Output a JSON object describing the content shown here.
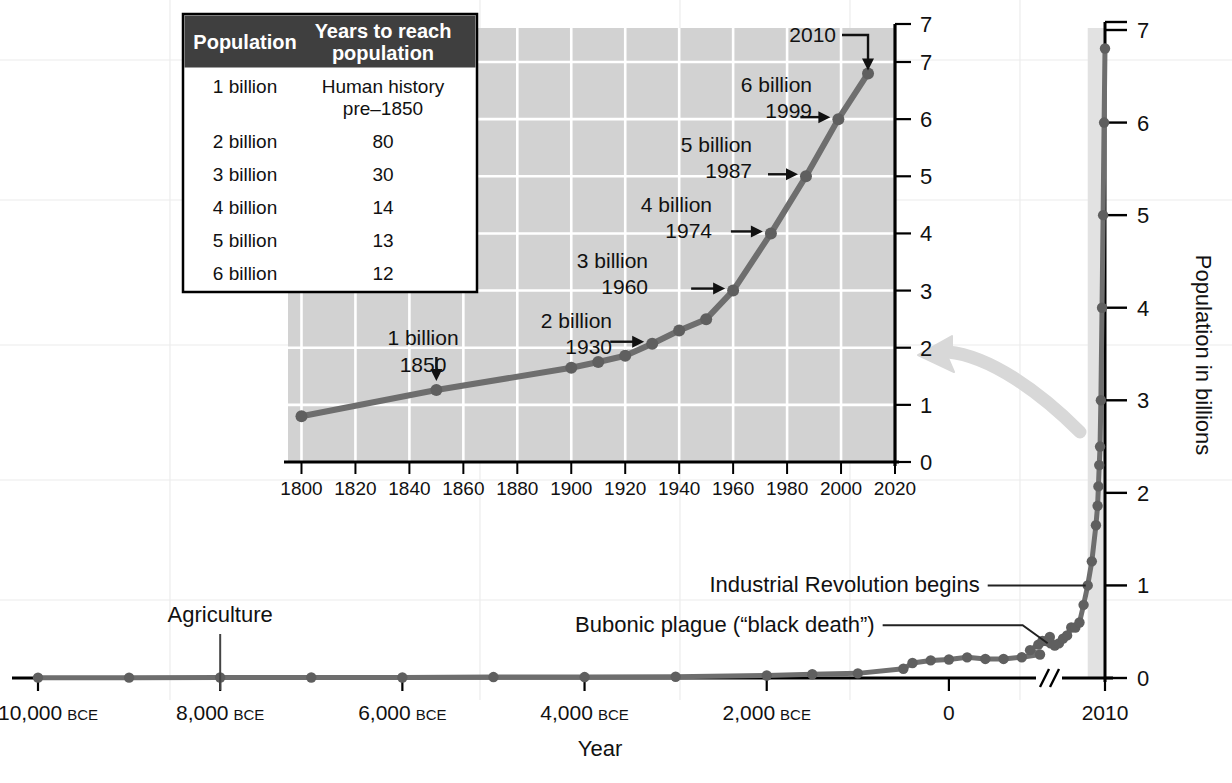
{
  "figure": {
    "main_xlabel": "Year",
    "main_ylabel": "Population in billions"
  },
  "table": {
    "headers": [
      "Population",
      "Years to reach population"
    ],
    "header_col1": "Population",
    "header_col2_line1": "Years to reach",
    "header_col2_line2": "population",
    "rows": [
      {
        "population": "1 billion",
        "years_line1": "Human history",
        "years_line2": "pre–1850"
      },
      {
        "population": "2 billion",
        "years_line1": "80",
        "years_line2": ""
      },
      {
        "population": "3 billion",
        "years_line1": "30",
        "years_line2": ""
      },
      {
        "population": "4 billion",
        "years_line1": "14",
        "years_line2": ""
      },
      {
        "population": "5 billion",
        "years_line1": "13",
        "years_line2": ""
      },
      {
        "population": "6 billion",
        "years_line1": "12",
        "years_line2": ""
      }
    ],
    "header_bg": "#3f3f3f",
    "body_bg": "#ffffff",
    "border": "#000000"
  },
  "colors": {
    "line": "#6e6e6e",
    "marker": "#5f5f5f",
    "inset_plot_bg": "#d2d2d2",
    "inset_grid": "#ffffff",
    "axis": "#000000",
    "main_grid": "#ececec",
    "highlight_band": "#e2e2e2",
    "callout_arrow": "#d8d8d8",
    "text": "#111111"
  },
  "chart_data": [
    {
      "id": "main",
      "type": "line",
      "title": "",
      "xlabel": "Year",
      "ylabel": "Population in billions",
      "xlim": [
        -10000,
        2010
      ],
      "ylim": [
        0,
        7
      ],
      "grid": true,
      "legend": "none",
      "axis_break": true,
      "axis_break_note": "break in x-axis between 1000 CE and 1500 CE region",
      "xticks": [
        -10000,
        -8000,
        -6000,
        -4000,
        -2000,
        0,
        2010
      ],
      "xticklabels": [
        "10,000 BCE",
        "8,000 BCE",
        "6,000 BCE",
        "4,000 BCE",
        "2,000 BCE",
        "0",
        "2010"
      ],
      "xtick_suffix": [
        "BCE",
        "BCE",
        "BCE",
        "BCE",
        "BCE",
        "",
        ""
      ],
      "xtick_numbers": [
        "10,000",
        "8,000",
        "6,000",
        "4,000",
        "2,000",
        "0",
        "2010"
      ],
      "yticks": [
        0,
        1,
        2,
        3,
        4,
        5,
        6,
        7
      ],
      "yticklabels": [
        "0",
        "1",
        "2",
        "3",
        "4",
        "5",
        "6",
        "7"
      ],
      "x": [
        -10000,
        -9000,
        -8000,
        -7000,
        -6000,
        -5000,
        -4000,
        -3000,
        -2000,
        -1500,
        -1000,
        -500,
        -400,
        -200,
        0,
        200,
        400,
        600,
        800,
        1000,
        1100,
        1200,
        1250,
        1300,
        1340,
        1350,
        1400,
        1450,
        1500,
        1550,
        1600,
        1650,
        1700,
        1750,
        1800,
        1850,
        1900,
        1920,
        1930,
        1940,
        1950,
        1960,
        1974,
        1987,
        1999,
        2010
      ],
      "y": [
        0.004,
        0.004,
        0.005,
        0.005,
        0.005,
        0.01,
        0.01,
        0.014,
        0.027,
        0.04,
        0.05,
        0.1,
        0.162,
        0.19,
        0.2,
        0.223,
        0.206,
        0.206,
        0.224,
        0.254,
        0.301,
        0.36,
        0.4,
        0.4,
        0.443,
        0.375,
        0.35,
        0.374,
        0.425,
        0.46,
        0.545,
        0.545,
        0.6,
        0.79,
        1.0,
        1.26,
        1.65,
        1.86,
        2.07,
        2.3,
        2.5,
        3.0,
        4.0,
        5.0,
        6.0,
        6.8
      ],
      "annotations": [
        {
          "label": "Agriculture",
          "x": -8000,
          "y": 0.005,
          "style": "vertical-leader"
        },
        {
          "label": "Bubonic plague (“black death”)",
          "x": 1350,
          "y": 0.375,
          "style": "horizontal-leader"
        },
        {
          "label": "Industrial Revolution begins",
          "x": 1800,
          "y": 1.0,
          "style": "horizontal-leader"
        }
      ],
      "highlight_band": {
        "x_start": 1800,
        "x_end": 2010
      }
    },
    {
      "id": "inset",
      "type": "line",
      "title": "",
      "xlabel": "",
      "ylabel": "",
      "xlim": [
        1795,
        2020
      ],
      "ylim": [
        0,
        7
      ],
      "grid": true,
      "legend": "none",
      "xticks": [
        1800,
        1820,
        1840,
        1860,
        1880,
        1900,
        1920,
        1940,
        1960,
        1980,
        2000,
        2020
      ],
      "xticklabels": [
        "1800",
        "1820",
        "1840",
        "1860",
        "1880",
        "1900",
        "1920",
        "1940",
        "1960",
        "1980",
        "2000",
        "2020"
      ],
      "yticks": [
        0,
        1,
        2,
        3,
        4,
        5,
        6,
        7
      ],
      "yticklabels": [
        "0",
        "1",
        "2",
        "3",
        "4",
        "5",
        "6",
        "7"
      ],
      "x": [
        1800,
        1850,
        1900,
        1910,
        1920,
        1930,
        1940,
        1950,
        1960,
        1974,
        1987,
        1999,
        2010
      ],
      "y": [
        0.8,
        1.26,
        1.65,
        1.75,
        1.86,
        2.07,
        2.3,
        2.5,
        3.0,
        4.0,
        5.0,
        6.0,
        6.8
      ],
      "annotations": [
        {
          "label_line1": "1 billion",
          "label_line2": "1850",
          "x": 1850,
          "y": 1.26,
          "arrow": "down"
        },
        {
          "label_line1": "2 billion",
          "label_line2": "1930",
          "x": 1930,
          "y": 2.07,
          "arrow": "right"
        },
        {
          "label_line1": "3 billion",
          "label_line2": "1960",
          "x": 1960,
          "y": 3.0,
          "arrow": "right"
        },
        {
          "label_line1": "4 billion",
          "label_line2": "1974",
          "x": 1974,
          "y": 4.0,
          "arrow": "right"
        },
        {
          "label_line1": "5 billion",
          "label_line2": "1987",
          "x": 1987,
          "y": 5.0,
          "arrow": "right"
        },
        {
          "label_line1": "6 billion",
          "label_line2": "1999",
          "x": 1999,
          "y": 6.0,
          "arrow": "right"
        },
        {
          "label_line1": "2010",
          "label_line2": "",
          "x": 2010,
          "y": 6.8,
          "arrow": "down"
        }
      ]
    }
  ],
  "annotations": {
    "agriculture": "Agriculture",
    "plague": "Bubonic plague (“black death”)",
    "industrial": "Industrial Revolution begins",
    "inset_1b_a": "1 billion",
    "inset_1b_b": "1850",
    "inset_2b_a": "2 billion",
    "inset_2b_b": "1930",
    "inset_3b_a": "3 billion",
    "inset_3b_b": "1960",
    "inset_4b_a": "4 billion",
    "inset_4b_b": "1974",
    "inset_5b_a": "5 billion",
    "inset_5b_b": "1987",
    "inset_6b_a": "6 billion",
    "inset_6b_b": "1999",
    "inset_2010": "2010"
  }
}
